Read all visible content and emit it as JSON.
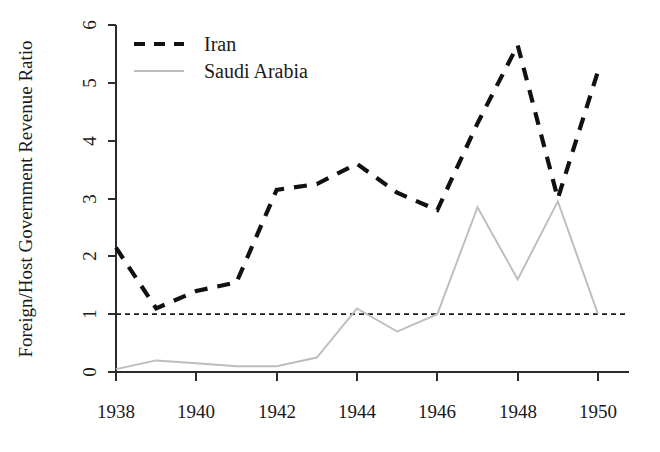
{
  "chart_data": {
    "type": "line",
    "title": "",
    "xlabel": "",
    "ylabel": "Foreign/Host Government Revenue Ratio",
    "x": [
      1938,
      1939,
      1940,
      1941,
      1942,
      1943,
      1944,
      1945,
      1946,
      1947,
      1948,
      1949,
      1950
    ],
    "xlim": [
      1938,
      1950
    ],
    "ylim": [
      0,
      6
    ],
    "xticks": [
      "1938",
      "1940",
      "1942",
      "1944",
      "1946",
      "1948",
      "1950"
    ],
    "xtick_values": [
      1938,
      1940,
      1942,
      1944,
      1946,
      1948,
      1950
    ],
    "yticks": [
      "0",
      "1",
      "2",
      "3",
      "4",
      "5",
      "6"
    ],
    "ytick_values": [
      0,
      1,
      2,
      3,
      4,
      5,
      6
    ],
    "grid": false,
    "legend_position": "top-left",
    "annotations": [
      {
        "name": "parity-reference-line",
        "type": "horizontal-line",
        "value": 1,
        "style": "dashed",
        "color": "#1a1a1a"
      }
    ],
    "series": [
      {
        "name": "Iran",
        "color": "#111111",
        "style": "dashed",
        "values": [
          2.15,
          1.1,
          1.4,
          1.55,
          3.15,
          3.25,
          3.6,
          3.1,
          2.8,
          4.3,
          5.65,
          3.0,
          5.2
        ]
      },
      {
        "name": "Saudi Arabia",
        "color": "#bdbdbd",
        "style": "solid",
        "values": [
          0.05,
          0.2,
          0.15,
          0.1,
          0.1,
          0.25,
          1.1,
          0.7,
          1.0,
          2.85,
          1.6,
          2.95,
          1.0
        ]
      }
    ]
  },
  "legend": {
    "items": [
      {
        "label": "Iran",
        "color": "#111111",
        "style": "dashed"
      },
      {
        "label": "Saudi Arabia",
        "color": "#bdbdbd",
        "style": "solid"
      }
    ]
  },
  "axes": {
    "y_title": "Foreign/Host Government Revenue Ratio",
    "y_tick_labels": [
      "0",
      "1",
      "2",
      "3",
      "4",
      "5",
      "6"
    ],
    "x_tick_labels": [
      "1938",
      "1940",
      "1942",
      "1944",
      "1946",
      "1948",
      "1950"
    ]
  }
}
